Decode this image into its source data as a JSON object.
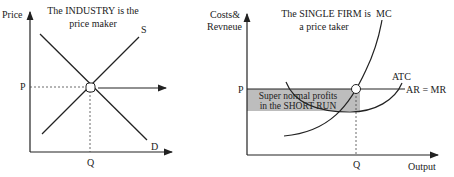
{
  "left_diagram": {
    "title_line1": "The INDUSTRY is the",
    "title_line2": "price maker",
    "y_axis_label": "Price",
    "x_axis_label": "",
    "price_label": "P",
    "quantity_label": "Q",
    "supply_label": "S",
    "demand_label": "D"
  },
  "right_diagram": {
    "title_line1": "The SINGLE FIRM is",
    "title_line2": "a price taker",
    "y_axis_label_line1": "Costs&",
    "y_axis_label_line2": "Revneue",
    "x_axis_label": "Output",
    "price_label": "P",
    "quantity_label": "Q",
    "mc_label": "MC",
    "atc_label": "ATC",
    "ar_mr_label": "AR = MR",
    "profit_box_line1": "Super normal profits",
    "profit_box_line2": "in the SHORT RUN"
  },
  "colors": {
    "line": "#222222",
    "profit_fill": "#bdbdbd"
  }
}
